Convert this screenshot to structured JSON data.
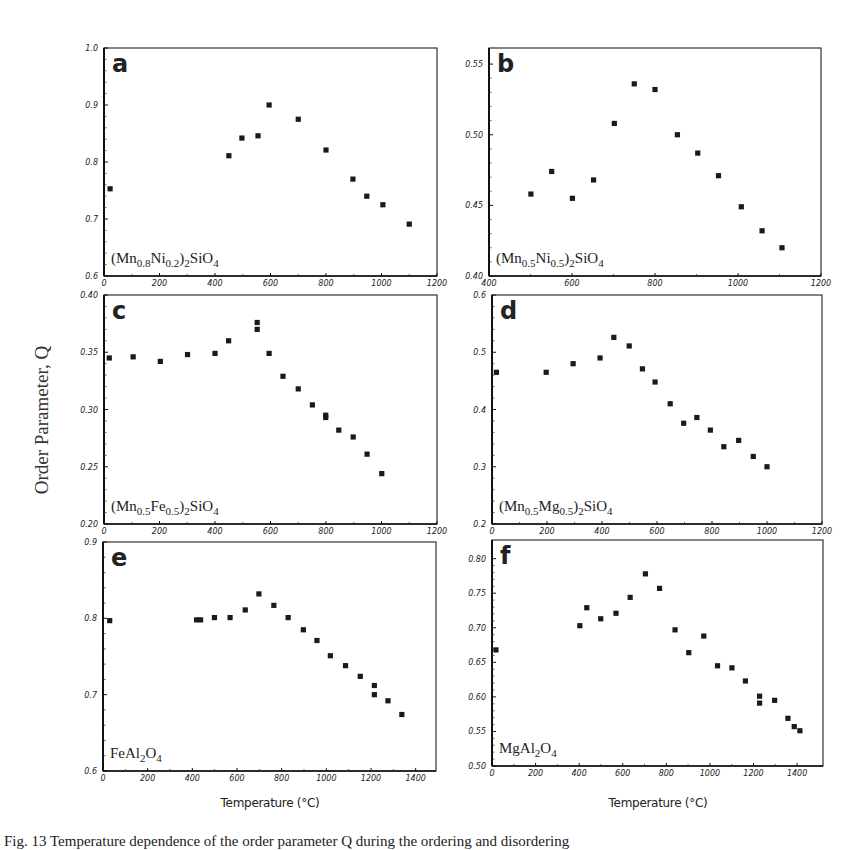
{
  "figure": {
    "y_axis_label": "Order Parameter, Q",
    "x_axis_label_left": "Temperature (°C)",
    "x_axis_label_right": "Temperature (°C)",
    "caption": "Fig. 13 Temperature dependence of the order parameter Q during the ordering and disordering"
  },
  "chart_data": [
    {
      "type": "scatter",
      "panel": "a",
      "title": "(Mn0.8Ni0.2)2SiO4",
      "compound": {
        "parts": [
          [
            "(Mn",
            ""
          ],
          [
            "0.8",
            "sub"
          ],
          [
            "Ni",
            ""
          ],
          [
            "0.2",
            "sub"
          ],
          [
            ")",
            ""
          ],
          [
            "2",
            "sub"
          ],
          [
            "SiO",
            ""
          ],
          [
            "4",
            "sub"
          ]
        ]
      },
      "xlabel": "Temperature (°C)",
      "ylabel": "Order Parameter, Q",
      "xlim": [
        0,
        1200
      ],
      "ylim": [
        0.6,
        1.0
      ],
      "xticks": [
        0,
        200,
        400,
        600,
        800,
        1000,
        1200
      ],
      "yticks": [
        0.6,
        0.7,
        0.8,
        0.9,
        1.0
      ],
      "ytick_labels": [
        "0.6",
        "0.7",
        "0.8",
        "0.9",
        "1.0"
      ],
      "box": {
        "x0": 104,
        "x1": 437,
        "y0": 48,
        "y1": 276
      },
      "x": [
        22,
        450,
        497,
        555,
        595,
        700,
        800,
        897,
        947,
        1005,
        1100
      ],
      "y": [
        0.753,
        0.811,
        0.842,
        0.846,
        0.9,
        0.875,
        0.821,
        0.77,
        0.74,
        0.725,
        0.691
      ]
    },
    {
      "type": "scatter",
      "panel": "b",
      "title": "(Mn0.5Ni0.5)2SiO4",
      "compound": {
        "parts": [
          [
            "(Mn",
            ""
          ],
          [
            "0.5",
            "sub"
          ],
          [
            "Ni",
            ""
          ],
          [
            "0.5",
            "sub"
          ],
          [
            ")",
            ""
          ],
          [
            "2",
            "sub"
          ],
          [
            "SiO",
            ""
          ],
          [
            "4",
            "sub"
          ]
        ]
      },
      "xlabel": "Temperature (°C)",
      "ylabel": "Order Parameter, Q",
      "xlim": [
        400,
        1200
      ],
      "ylim": [
        0.4,
        0.5614
      ],
      "xticks": [
        400,
        600,
        800,
        1000,
        1200
      ],
      "yticks": [
        0.4,
        0.45,
        0.5,
        0.55
      ],
      "ytick_labels": [
        "0.40",
        "0.45",
        "0.50",
        "0.55"
      ],
      "box": {
        "x0": 489,
        "x1": 821,
        "y0": 48,
        "y1": 276
      },
      "x": [
        501,
        551,
        601,
        652,
        702,
        750,
        800,
        854,
        903,
        953,
        1008,
        1058,
        1106
      ],
      "y": [
        0.458,
        0.474,
        0.455,
        0.468,
        0.508,
        0.536,
        0.532,
        0.5,
        0.487,
        0.471,
        0.449,
        0.432,
        0.42
      ]
    },
    {
      "type": "scatter",
      "panel": "c",
      "title": "(Mn0.5Fe0.5)2SiO4",
      "compound": {
        "parts": [
          [
            "(Mn",
            ""
          ],
          [
            "0.5",
            "sub"
          ],
          [
            "Fe",
            ""
          ],
          [
            "0.5",
            "sub"
          ],
          [
            ")",
            ""
          ],
          [
            "2",
            "sub"
          ],
          [
            "SiO",
            ""
          ],
          [
            "4",
            "sub"
          ]
        ]
      },
      "xlabel": "Temperature (°C)",
      "ylabel": "Order Parameter, Q",
      "xlim": [
        0,
        1200
      ],
      "ylim": [
        0.2,
        0.4
      ],
      "xticks": [
        0,
        200,
        400,
        600,
        800,
        1000,
        1200
      ],
      "yticks": [
        0.2,
        0.25,
        0.3,
        0.35,
        0.4
      ],
      "ytick_labels": [
        "0.20",
        "0.25",
        "0.30",
        "0.35",
        "0.40"
      ],
      "box": {
        "x0": 104,
        "x1": 437,
        "y0": 295,
        "y1": 524
      },
      "x": [
        19,
        105,
        203,
        301,
        400,
        449,
        552,
        552,
        595,
        645,
        700,
        751,
        799,
        799,
        846,
        898,
        948,
        1001
      ],
      "y": [
        0.345,
        0.346,
        0.342,
        0.348,
        0.349,
        0.36,
        0.376,
        0.37,
        0.349,
        0.329,
        0.318,
        0.304,
        0.295,
        0.293,
        0.282,
        0.276,
        0.261,
        0.244
      ]
    },
    {
      "type": "scatter",
      "panel": "d",
      "title": "(Mn0.5Mg0.5)2SiO4",
      "compound": {
        "parts": [
          [
            "(Mn",
            ""
          ],
          [
            "0.5",
            "sub"
          ],
          [
            "Mg",
            ""
          ],
          [
            "0.5",
            "sub"
          ],
          [
            ")",
            ""
          ],
          [
            "2",
            "sub"
          ],
          [
            "SiO",
            ""
          ],
          [
            "4",
            "sub"
          ]
        ]
      },
      "xlabel": "Temperature (°C)",
      "ylabel": "Order Parameter, Q",
      "xlim": [
        0,
        1200
      ],
      "ylim": [
        0.2,
        0.6
      ],
      "xticks": [
        0,
        200,
        400,
        600,
        800,
        1000,
        1200
      ],
      "yticks": [
        0.2,
        0.3,
        0.4,
        0.5,
        0.6
      ],
      "ytick_labels": [
        "0.2",
        "0.3",
        "0.4",
        "0.5",
        "0.6"
      ],
      "box": {
        "x0": 492,
        "x1": 822,
        "y0": 295,
        "y1": 524
      },
      "x": [
        16,
        197,
        295,
        393,
        443,
        499,
        547,
        593,
        648,
        697,
        745,
        794,
        843,
        897,
        950,
        1000
      ],
      "y": [
        0.465,
        0.465,
        0.48,
        0.49,
        0.526,
        0.511,
        0.471,
        0.448,
        0.41,
        0.376,
        0.386,
        0.364,
        0.335,
        0.346,
        0.318,
        0.3
      ]
    },
    {
      "type": "scatter",
      "panel": "e",
      "title": "FeAl2O4",
      "compound": {
        "parts": [
          [
            "FeAl",
            ""
          ],
          [
            "2",
            "sub"
          ],
          [
            "O",
            ""
          ],
          [
            "4",
            "sub"
          ]
        ]
      },
      "xlabel": "Temperature (°C)",
      "ylabel": "Order Parameter, Q",
      "xlim": [
        0,
        1491
      ],
      "ylim": [
        0.6,
        0.9
      ],
      "xticks": [
        0,
        200,
        400,
        600,
        800,
        1000,
        1200,
        1400
      ],
      "yticks": [
        0.6,
        0.7,
        0.8,
        0.9
      ],
      "ytick_labels": [
        "0.6",
        "0.7",
        "0.8",
        "0.9"
      ],
      "box": {
        "x0": 103,
        "x1": 436,
        "y0": 542,
        "y1": 771
      },
      "x": [
        30,
        419,
        437,
        499,
        569,
        637,
        698,
        765,
        829,
        897,
        958,
        1018,
        1086,
        1152,
        1215,
        1215,
        1276,
        1338
      ],
      "y": [
        0.797,
        0.798,
        0.798,
        0.801,
        0.801,
        0.811,
        0.832,
        0.817,
        0.801,
        0.785,
        0.771,
        0.751,
        0.738,
        0.724,
        0.712,
        0.7,
        0.692,
        0.674
      ]
    },
    {
      "type": "scatter",
      "panel": "f",
      "title": "MgAl2O4",
      "compound": {
        "parts": [
          [
            "MgAl",
            ""
          ],
          [
            "2",
            "sub"
          ],
          [
            "O",
            ""
          ],
          [
            "4",
            "sub"
          ]
        ]
      },
      "xlabel": "Temperature (°C)",
      "ylabel": "Order Parameter, Q",
      "xlim": [
        0,
        1519
      ],
      "ylim": [
        0.5,
        0.827
      ],
      "xticks": [
        0,
        200,
        400,
        600,
        800,
        1000,
        1200,
        1400
      ],
      "yticks": [
        0.5,
        0.55,
        0.6,
        0.65,
        0.7,
        0.75,
        0.8
      ],
      "ytick_labels": [
        "0.50",
        "0.55",
        "0.60",
        "0.65",
        "0.70",
        "0.75",
        "0.80"
      ],
      "box": {
        "x0": 492,
        "x1": 823,
        "y0": 540,
        "y1": 766
      },
      "x": [
        18,
        403,
        435,
        499,
        569,
        634,
        704,
        769,
        840,
        903,
        972,
        1035,
        1101,
        1163,
        1228,
        1228,
        1297,
        1358,
        1387,
        1413
      ],
      "y": [
        0.668,
        0.703,
        0.729,
        0.713,
        0.721,
        0.744,
        0.778,
        0.757,
        0.697,
        0.664,
        0.688,
        0.645,
        0.642,
        0.623,
        0.601,
        0.591,
        0.595,
        0.569,
        0.557,
        0.551
      ]
    }
  ]
}
